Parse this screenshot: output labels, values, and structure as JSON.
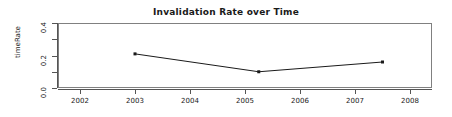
{
  "chart_data": {
    "type": "line",
    "title": "Invalidation Rate over Time",
    "xlabel": "",
    "ylabel": "timeRate",
    "x": [
      2003.0,
      2005.25,
      2007.5
    ],
    "values": [
      0.21,
      0.1,
      0.16
    ],
    "xlim": [
      2001.6,
      2008.4
    ],
    "ylim": [
      0.0,
      0.4
    ],
    "xticks": [
      2002,
      2003,
      2004,
      2005,
      2006,
      2007,
      2008
    ],
    "xtick_labels": [
      "2002",
      "2003",
      "2004",
      "2005",
      "2006",
      "2007",
      "2008"
    ],
    "yticks": [
      0.0,
      0.2,
      0.4
    ],
    "ytick_labels": [
      "0.0",
      "0.2",
      "0.4"
    ],
    "yticks_minor": [
      0.1,
      0.3
    ],
    "grid": false,
    "legend": null,
    "series": [
      {
        "name": "timeRate",
        "points": [
          {
            "x": 2003.0,
            "y": 0.21
          },
          {
            "x": 2005.25,
            "y": 0.1
          },
          {
            "x": 2007.5,
            "y": 0.16
          }
        ],
        "marker": "square",
        "color": "#1a1a1a"
      }
    ]
  },
  "colors": {
    "axis": "#555555",
    "frame": "#808080",
    "line": "#1a1a1a",
    "text": "#1a1a1a",
    "background": "#ffffff"
  }
}
